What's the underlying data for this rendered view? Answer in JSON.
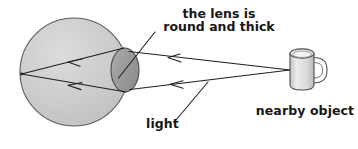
{
  "diagram": {
    "title_present": false,
    "background_color": "#ffffff",
    "labels": {
      "lens_line1": "the lens is",
      "lens_line2": "round and thick",
      "light": "light",
      "object": "nearby object"
    },
    "parts": {
      "eyeball_name": "eyeball",
      "lens_name": "lens",
      "object_name": "mug",
      "focal_point_name": "focal-point"
    },
    "colors": {
      "eyeball_fill": "#c9c9c9",
      "eyeball_fill_light": "#d8d8d8",
      "lens_fill": "#9c9c9c",
      "lens_fill_light": "#ababab",
      "mug_body_fill": "#d4d4d4",
      "mug_body_light": "#efefef",
      "mug_rim_fill": "#f4f4f4",
      "outline": "#3a3a3a",
      "ray_color": "#1f1f1f",
      "text_color": "#171717"
    },
    "geometry": {
      "eyeball_center_x": 74,
      "eyeball_center_y": 72,
      "eyeball_radius": 54,
      "lens_center_x": 125,
      "lens_center_y": 70,
      "lens_rx": 14,
      "lens_ry": 22,
      "focal_point_x": 21,
      "focal_point_y": 74,
      "object_point_x": 290,
      "object_point_y": 70,
      "mug_left": 290,
      "mug_top": 50,
      "mug_width": 24,
      "mug_height": 38
    },
    "rays": [
      {
        "name": "upper-incoming-ray",
        "from_x": 290,
        "from_y": 70,
        "to_x": 130,
        "to_y": 52,
        "arrow_at_x": 178,
        "arrow_at_y": 57.4,
        "direction": "leftward"
      },
      {
        "name": "lower-incoming-ray",
        "from_x": 290,
        "from_y": 70,
        "to_x": 131,
        "to_y": 89,
        "arrow_at_x": 180,
        "arrow_at_y": 82.8,
        "direction": "leftward"
      },
      {
        "name": "upper-refracted-ray",
        "from_x": 124,
        "from_y": 48,
        "to_x": 21,
        "to_y": 74,
        "arrow_at_x": 80,
        "arrow_at_y": 59.1,
        "direction": "leftward"
      },
      {
        "name": "lower-refracted-ray",
        "from_x": 125,
        "from_y": 92,
        "to_x": 21,
        "to_y": 74,
        "arrow_at_x": 80,
        "arrow_at_y": 84.2,
        "direction": "leftward"
      }
    ],
    "leader_lines": [
      {
        "name": "lens-leader-line",
        "from_x": 155,
        "from_y": 33,
        "to_x": 119,
        "to_y": 78
      },
      {
        "name": "light-leader-line",
        "from_x": 176,
        "from_y": 119,
        "to_x": 207,
        "to_y": 83
      }
    ]
  }
}
